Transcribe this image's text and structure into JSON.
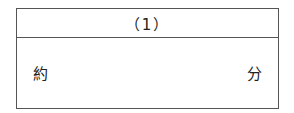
{
  "answer_box": {
    "header": "（1）",
    "prefix": "約",
    "suffix": "分",
    "value": ""
  }
}
